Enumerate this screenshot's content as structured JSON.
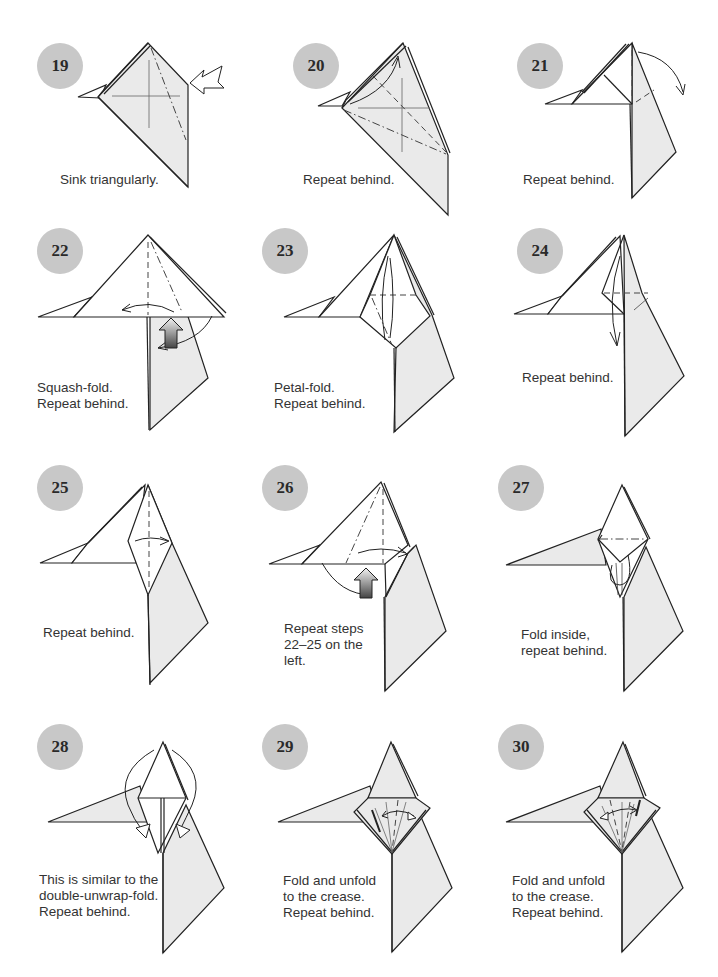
{
  "page": {
    "type": "origami-instructions",
    "badge_color": "#c8c8c8",
    "paper_color": "#eaeaea"
  },
  "steps": [
    {
      "number": "19",
      "caption": "Sink triangularly.",
      "symbols": [
        "mountain-fold-line",
        "crease-cross",
        "sink-arrow"
      ]
    },
    {
      "number": "20",
      "caption": "Repeat behind.",
      "symbols": [
        "valley-fold-line",
        "mountain-fold-line",
        "fold-arrow"
      ]
    },
    {
      "number": "21",
      "caption": "Repeat behind.",
      "symbols": [
        "fold-arrow"
      ]
    },
    {
      "number": "22",
      "caption": "Squash-fold.\nRepeat behind.",
      "symbols": [
        "valley-fold-line",
        "squash-arrow",
        "fold-arrow"
      ]
    },
    {
      "number": "23",
      "caption": "Petal-fold.\nRepeat behind.",
      "symbols": [
        "valley-fold-line",
        "fold-arrow"
      ]
    },
    {
      "number": "24",
      "caption": "Repeat behind.",
      "symbols": [
        "valley-fold-line",
        "fold-arrow"
      ]
    },
    {
      "number": "25",
      "caption": "Repeat behind.",
      "symbols": [
        "valley-fold-line",
        "fold-arrow"
      ]
    },
    {
      "number": "26",
      "caption": "Repeat steps\n22–25 on the\nleft.",
      "symbols": [
        "valley-fold-line",
        "squash-arrow",
        "fold-arrow"
      ]
    },
    {
      "number": "27",
      "caption": "Fold inside,\nrepeat behind.",
      "symbols": [
        "mountain-fold-line",
        "fold-arrow"
      ]
    },
    {
      "number": "28",
      "caption": "This is similar to the\ndouble-unwrap-fold.\nRepeat behind.",
      "symbols": [
        "unwrap-arrows"
      ]
    },
    {
      "number": "29",
      "caption": "Fold and unfold\nto the crease.\nRepeat behind.",
      "symbols": [
        "valley-fold-line",
        "fold-unfold-arrow"
      ]
    },
    {
      "number": "30",
      "caption": "Fold and unfold\nto the crease.\nRepeat behind.",
      "symbols": [
        "valley-fold-line",
        "fold-unfold-arrow"
      ]
    }
  ]
}
